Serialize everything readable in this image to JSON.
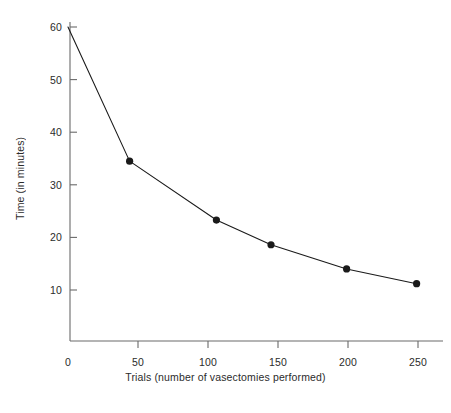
{
  "chart_data": {
    "type": "line",
    "title": "",
    "subtitle": "",
    "xlabel": "Trials (number of vasectomies performed)",
    "ylabel": "Time (in minutes)",
    "x": [
      0,
      44,
      106,
      145,
      199,
      249
    ],
    "values": [
      60,
      34.5,
      23.3,
      18.6,
      14.0,
      11.2
    ],
    "series": [
      {
        "name": "Time per vasectomy",
        "x": [
          0,
          44,
          106,
          145,
          199,
          249
        ],
        "values": [
          60,
          34.5,
          23.3,
          18.6,
          14.0,
          11.2
        ],
        "marker": "filled-circle",
        "marker_first_point": false,
        "color": "#1a1a1a"
      }
    ],
    "xlim": [
      0,
      256
    ],
    "ylim": [
      0,
      62
    ],
    "xticks": [
      0,
      50,
      100,
      150,
      200,
      250
    ],
    "xtick_labels": [
      "0",
      "50",
      "100",
      "150",
      "200",
      "250"
    ],
    "yticks": [
      10,
      20,
      30,
      40,
      50,
      60
    ],
    "ytick_labels": [
      "10",
      "20",
      "30",
      "40",
      "50",
      "60"
    ],
    "grid": false,
    "legend": null,
    "legend_position": "none",
    "annotations": [],
    "line_color": "#1a1a1a",
    "axis_color": "#555555",
    "background": "#ffffff"
  }
}
